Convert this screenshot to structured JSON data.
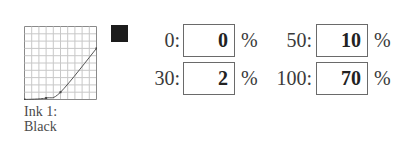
{
  "ink": {
    "label_line1": "Ink 1:",
    "label_line2": "Black",
    "swatch_color": "#1c1c1c"
  },
  "curve": {
    "icon": "transfer-curve-icon",
    "grid_divisions": 10,
    "points": [
      [
        0,
        0
      ],
      [
        30,
        2
      ],
      [
        50,
        10
      ],
      [
        100,
        70
      ]
    ]
  },
  "fields": [
    {
      "label": "0:",
      "value": "0",
      "unit": "%"
    },
    {
      "label": "30:",
      "value": "2",
      "unit": "%"
    },
    {
      "label": "50:",
      "value": "10",
      "unit": "%"
    },
    {
      "label": "100:",
      "value": "70",
      "unit": "%"
    }
  ]
}
